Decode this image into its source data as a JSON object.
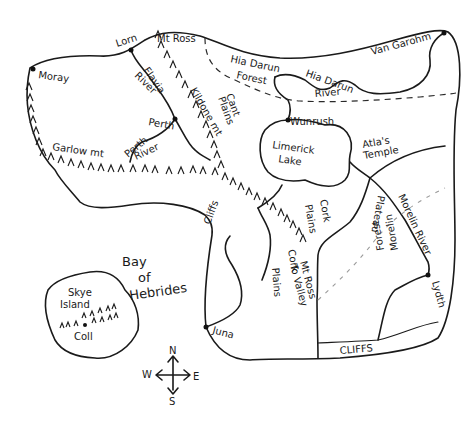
{
  "map": {
    "title": "Hand-drawn fantasy map",
    "ink_color": "#1a1a1a",
    "background": "#ffffff",
    "towns": [
      {
        "name": "Moray",
        "x": 34,
        "y": 69
      },
      {
        "name": "Lorn",
        "x": 131,
        "y": 50
      },
      {
        "name": "Perth",
        "x": 175,
        "y": 119
      },
      {
        "name": "Van Garohm",
        "x": 444,
        "y": 33
      },
      {
        "name": "Juna",
        "x": 206,
        "y": 327
      },
      {
        "name": "Lydth",
        "x": 428,
        "y": 275
      },
      {
        "name": "Wunrush",
        "x": 288,
        "y": 120
      }
    ],
    "labels": {
      "moray": "Moray",
      "lorn": "Lorn",
      "mt_ross": "Mt Ross",
      "flavia_river_1": "Flavia",
      "flavia_river_2": "River",
      "kildone_mt": "Kildone mt",
      "cant_plains_1": "Cant",
      "cant_plains_2": "Plains",
      "hia_darun_forest_1": "Hia Darun",
      "hia_darun_forest_2": "Forest",
      "hia_darun_river_1": "Hia Darun",
      "hia_darun_river_2": "River",
      "van_garohm": "Van Garohm",
      "perth": "Perth",
      "perth_river_1": "Perth",
      "perth_river_2": "River",
      "garlow_mt": "Garlow mt",
      "wunrush": "Wunrush",
      "limerick_lake_1": "Limerick",
      "limerick_lake_2": "Lake",
      "atlas_temple_1": "Atla's",
      "atlas_temple_2": "Temple",
      "cliffs_west": "Cliffs",
      "cork_plains_north_1": "Cork",
      "cork_plains_north_2": "Plains",
      "cork_plains_south_1": "Cork",
      "cork_plains_south_2": "Plains",
      "mt_ross_valley_1": "Mt Ross",
      "mt_ross_valley_2": "To Valley",
      "plateau": "Plateau",
      "morelin_river": "Morelin River",
      "morelin_forest_1": "Morelin",
      "morelin_forest_2": "Forest",
      "lydth": "Lydth",
      "juna": "Juna",
      "cliffs_south": "CLIFFS",
      "bay_1": "Bay",
      "bay_2": "of",
      "bay_3": "Hebrides",
      "skye_island_1": "Skye",
      "skye_island_2": "Island",
      "coll": "Coll"
    },
    "compass": {
      "n": "N",
      "s": "S",
      "e": "E",
      "w": "W"
    }
  }
}
